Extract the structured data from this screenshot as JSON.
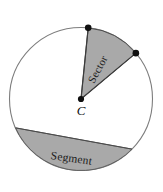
{
  "figure": {
    "kind": "geometry-diagram",
    "background_color": "#ffffff",
    "circle": {
      "center_label": "C",
      "center_x": 81,
      "center_y": 99,
      "radius": 71.5,
      "outline_color": "#7d7d7d",
      "fill_color": "#ffffff",
      "outline_width": 1.1
    },
    "shaded_fill_color": "#a9a9a9",
    "shaded_edge_color": "#4a4a4a",
    "sector": {
      "label": "Sector",
      "label_rotation_deg": -62,
      "label_x": 101,
      "label_y": 71,
      "fill_color": "#a9a9a9",
      "start_point_x": 89,
      "start_point_y": 20,
      "end_point_x": 142,
      "end_point_y": 48
    },
    "segment": {
      "label": "Segment",
      "label_rotation_deg": 8,
      "label_x": 71,
      "label_y": 162,
      "fill_color": "#a9a9a9",
      "chord_left_x": 13,
      "chord_left_y": 129,
      "chord_right_x": 139,
      "chord_right_y": 156
    },
    "points": [
      {
        "name": "center-point",
        "label": "C",
        "x": 81,
        "y": 99,
        "radius": 3.1
      },
      {
        "name": "sector-arc-start-point",
        "label": "",
        "x": 89,
        "y": 20,
        "radius": 3.3
      },
      {
        "name": "sector-arc-end-point",
        "label": "",
        "x": 142,
        "y": 48,
        "radius": 3.3
      }
    ],
    "center_label_offset_x": 0,
    "center_label_offset_y": 16
  }
}
